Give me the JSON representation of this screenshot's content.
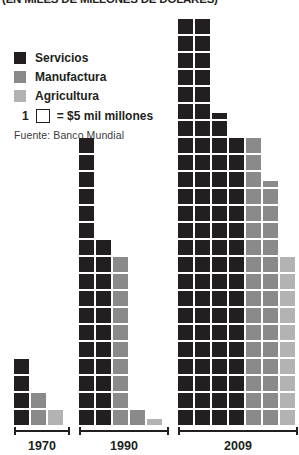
{
  "title": "(EN MILES DE MILLONES DE DÓLARES)",
  "legend": {
    "items": [
      {
        "label": "Servicios",
        "color": "#231f20"
      },
      {
        "label": "Manufactura",
        "color": "#8a8a8a"
      },
      {
        "label": "Agricultura",
        "color": "#b3b3b3"
      }
    ],
    "unit": {
      "count": "1",
      "box_icon": "empty-square-icon",
      "text": "= $5 mil millones"
    }
  },
  "source": "Fuente: Banco Mundial",
  "colors": {
    "servicios": "#231f20",
    "manufactura": "#8a8a8a",
    "agricultura": "#b3b3b3",
    "axis": "#231f20",
    "background": "#ffffff"
  },
  "chart_data": {
    "type": "bar",
    "subtype": "pictogram-isotype",
    "title": "(EN MILES DE MILLONES DE DÓLARES)",
    "xlabel": "",
    "ylabel": "",
    "unit_value": 5,
    "unit_label": "$5 mil millones",
    "source": "Fuente: Banco Mundial",
    "categories": [
      "1970",
      "1990",
      "2009"
    ],
    "series": [
      {
        "name": "Servicios",
        "color": "#231f20",
        "squares": [
          4,
          21,
          44
        ],
        "values": [
          20,
          105,
          220
        ]
      },
      {
        "name": "Manufactura",
        "color": "#8a8a8a",
        "squares": [
          2,
          12,
          31
        ],
        "values": [
          10,
          60,
          155
        ]
      },
      {
        "name": "Agricultura",
        "color": "#b3b3b3",
        "squares": [
          1,
          1,
          10
        ],
        "values": [
          5,
          5,
          50
        ]
      }
    ],
    "columns": [
      {
        "group": "1970",
        "stacks": [
          {
            "series": "Servicios",
            "color": "#231f20",
            "full": 4,
            "half": 0
          },
          {
            "series": "Manufactura",
            "color": "#8a8a8a",
            "full": 2,
            "half": 0
          },
          {
            "series": "Agricultura",
            "color": "#b3b3b3",
            "full": 1,
            "half": 0
          }
        ]
      },
      {
        "group": "1990",
        "stacks": [
          {
            "series": "Servicios",
            "color": "#231f20",
            "full": 17,
            "half": 0
          },
          {
            "series": "Servicios",
            "color": "#231f20",
            "full": 11,
            "half": 0
          },
          {
            "series": "Manufactura",
            "color": "#8a8a8a",
            "full": 10,
            "half": 0
          },
          {
            "series": "Manufactura",
            "color": "#8a8a8a",
            "full": 1,
            "half": 0
          },
          {
            "series": "Agricultura",
            "color": "#b3b3b3",
            "full": 0,
            "half": 1
          }
        ]
      },
      {
        "group": "2009",
        "stacks": [
          {
            "series": "Servicios",
            "color": "#231f20",
            "full": 24,
            "half": 0
          },
          {
            "series": "Servicios",
            "color": "#231f20",
            "full": 24,
            "half": 0
          },
          {
            "series": "Servicios",
            "color": "#231f20",
            "full": 18,
            "half": 1
          },
          {
            "series": "Servicios",
            "color": "#231f20",
            "full": 17,
            "half": 0
          },
          {
            "series": "Manufactura",
            "color": "#8a8a8a",
            "full": 17,
            "half": 0
          },
          {
            "series": "Manufactura",
            "color": "#8a8a8a",
            "full": 14,
            "half": 1
          },
          {
            "series": "Agricultura",
            "color": "#b3b3b3",
            "full": 10,
            "half": 0
          }
        ]
      }
    ],
    "groups_layout": [
      {
        "label": "1970",
        "left": 14,
        "width": 56,
        "stack_pitch": 17
      },
      {
        "label": "1990",
        "left": 79,
        "width": 90,
        "stack_pitch": 17
      },
      {
        "label": "2009",
        "left": 178,
        "width": 120,
        "stack_pitch": 17
      }
    ]
  }
}
